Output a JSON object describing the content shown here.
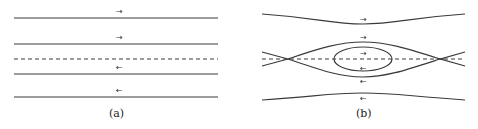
{
  "figure": {
    "panels": [
      {
        "id": "a",
        "caption": "(a)",
        "description": "Parallel shear flow streamlines",
        "arrows": [
          "→",
          "→",
          "←",
          "←"
        ]
      },
      {
        "id": "b",
        "caption": "(b)",
        "description": "Cat's-eye streamlines with separatrix and closed orbit",
        "arrows": [
          "→",
          "→",
          "→",
          "←",
          "←",
          "←"
        ]
      }
    ],
    "colors": {
      "line": "#3a3a3a",
      "background": "#ffffff"
    }
  }
}
